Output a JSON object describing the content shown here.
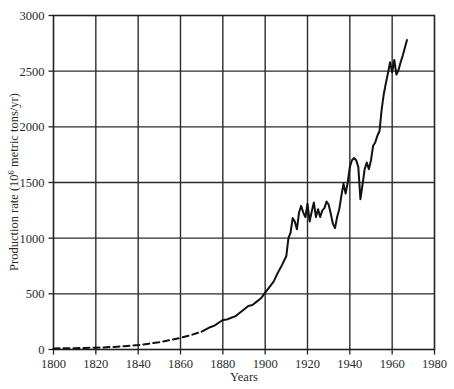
{
  "chart_data": {
    "type": "line",
    "title": "",
    "xlabel": "Years",
    "ylabel": "Production rate (10^6 metric tons/yr)",
    "ylabel_prefix": "Production rate (10",
    "ylabel_exponent": "6",
    "ylabel_suffix": " metric tons/yr)",
    "xlim": [
      1800,
      1980
    ],
    "ylim": [
      0,
      3000
    ],
    "xticks": [
      1800,
      1820,
      1840,
      1860,
      1880,
      1900,
      1920,
      1940,
      1960,
      1980
    ],
    "yticks": [
      0,
      500,
      1000,
      1500,
      2000,
      2500,
      3000
    ],
    "xtick_labels": [
      "1800",
      "1820",
      "1840",
      "1860",
      "1880",
      "1900",
      "1920",
      "1940",
      "1960",
      "1980"
    ],
    "ytick_labels": [
      "0",
      "500",
      "1000",
      "1500",
      "2000",
      "2500",
      "3000"
    ],
    "grid": true,
    "grid_color": "#2b2b2b",
    "legend": null,
    "line_color": "#111111",
    "series": [
      {
        "name": "Estimated production (dashed)",
        "style": "dashed",
        "x": [
          1800,
          1805,
          1810,
          1815,
          1820,
          1825,
          1830,
          1835,
          1840,
          1845,
          1850,
          1855,
          1860,
          1865,
          1870
        ],
        "values": [
          10,
          11,
          12,
          14,
          16,
          20,
          25,
          32,
          40,
          52,
          66,
          84,
          105,
          130,
          160
        ]
      },
      {
        "name": "Measured production (solid)",
        "style": "solid",
        "x": [
          1870,
          1872,
          1874,
          1876,
          1878,
          1880,
          1882,
          1884,
          1886,
          1888,
          1890,
          1892,
          1894,
          1896,
          1898,
          1900,
          1902,
          1904,
          1906,
          1908,
          1910,
          1911,
          1912,
          1913,
          1914,
          1915,
          1916,
          1917,
          1918,
          1919,
          1920,
          1921,
          1922,
          1923,
          1924,
          1925,
          1926,
          1927,
          1928,
          1929,
          1930,
          1931,
          1932,
          1933,
          1934,
          1935,
          1936,
          1937,
          1938,
          1939,
          1940,
          1941,
          1942,
          1943,
          1944,
          1945,
          1946,
          1947,
          1948,
          1949,
          1950,
          1951,
          1952,
          1953,
          1954,
          1955,
          1956,
          1957,
          1958,
          1959,
          1960,
          1961,
          1962,
          1963,
          1964,
          1965,
          1966,
          1967
        ],
        "values": [
          160,
          180,
          200,
          215,
          240,
          265,
          270,
          285,
          300,
          330,
          360,
          390,
          400,
          430,
          460,
          510,
          560,
          610,
          690,
          760,
          840,
          1000,
          1050,
          1180,
          1150,
          1080,
          1230,
          1290,
          1230,
          1190,
          1310,
          1150,
          1240,
          1320,
          1190,
          1260,
          1190,
          1250,
          1270,
          1330,
          1300,
          1220,
          1130,
          1090,
          1190,
          1260,
          1380,
          1490,
          1400,
          1500,
          1640,
          1700,
          1720,
          1700,
          1640,
          1350,
          1480,
          1620,
          1680,
          1620,
          1700,
          1830,
          1860,
          1920,
          1960,
          2150,
          2290,
          2390,
          2480,
          2580,
          2490,
          2600,
          2470,
          2510,
          2580,
          2640,
          2710,
          2780
        ]
      }
    ]
  },
  "axis": {
    "x_title": "Years",
    "y_title_prefix": "Production rate (10",
    "y_title_exponent": "6",
    "y_title_suffix": " metric tons/yr)"
  }
}
